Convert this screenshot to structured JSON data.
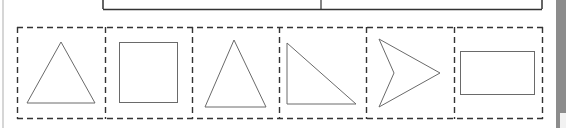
{
  "page": {
    "background": "#ffffff",
    "stroke_color": "#333333",
    "shape_stroke_color": "#666666",
    "strip_color": "#8c8c8c"
  },
  "top_table": {
    "cells": [
      {
        "index": 0,
        "text": ""
      },
      {
        "index": 1,
        "text": ""
      }
    ]
  },
  "shape_row": {
    "box_style": "dashed",
    "boxes": [
      {
        "index": 0,
        "shape": "equilateral-triangle"
      },
      {
        "index": 1,
        "shape": "square"
      },
      {
        "index": 2,
        "shape": "isosceles-triangle"
      },
      {
        "index": 3,
        "shape": "right-triangle"
      },
      {
        "index": 4,
        "shape": "arrowhead-concave-quadrilateral"
      },
      {
        "index": 5,
        "shape": "rectangle"
      }
    ]
  }
}
